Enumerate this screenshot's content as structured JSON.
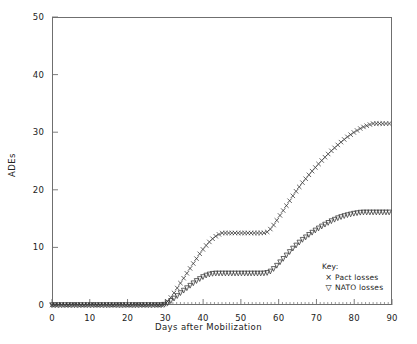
{
  "chart_data": {
    "type": "line",
    "title": "",
    "xlabel": "Days after Mobilization",
    "ylabel": "ADEs",
    "xlim": [
      0,
      90
    ],
    "ylim": [
      0,
      50
    ],
    "xticks": [
      0,
      10,
      20,
      30,
      40,
      50,
      60,
      70,
      80,
      90
    ],
    "yticks": [
      0,
      10,
      20,
      30,
      40,
      50
    ],
    "xtick_labels": [
      "0",
      "10",
      "20",
      "30",
      "40",
      "50",
      "60",
      "70",
      "80",
      "90"
    ],
    "ytick_labels": [
      "0",
      "10",
      "20",
      "30",
      "40",
      "50"
    ],
    "grid": false,
    "legend_position": "inside lower right",
    "legend_title": "Key:",
    "series": [
      {
        "name": "Pact losses",
        "marker": "x",
        "marker_glyph": "×",
        "color": "#333333",
        "x": [
          0,
          2,
          4,
          6,
          8,
          10,
          12,
          14,
          16,
          18,
          20,
          22,
          24,
          26,
          28,
          29,
          30,
          31,
          32,
          33,
          34,
          35,
          36,
          37,
          38,
          39,
          40,
          41,
          42,
          43,
          44,
          45,
          46,
          47,
          48,
          50,
          52,
          54,
          56,
          57,
          58,
          59,
          60,
          61,
          62,
          63,
          64,
          65,
          66,
          68,
          70,
          72,
          74,
          76,
          78,
          80,
          82,
          84,
          85,
          86,
          87,
          88,
          89,
          90
        ],
        "y": [
          0,
          0,
          0,
          0,
          0,
          0,
          0,
          0,
          0,
          0,
          0,
          0,
          0,
          0,
          0,
          0,
          0.2,
          0.9,
          1.8,
          2.8,
          3.8,
          4.8,
          5.8,
          6.8,
          7.8,
          8.8,
          9.7,
          10.5,
          11.2,
          11.8,
          12.2,
          12.5,
          12.5,
          12.5,
          12.5,
          12.5,
          12.5,
          12.5,
          12.5,
          12.7,
          13.3,
          14.2,
          15.2,
          16.2,
          17.2,
          18.2,
          19.2,
          20.1,
          21.0,
          22.6,
          24.1,
          25.5,
          26.8,
          28.0,
          29.1,
          30.0,
          30.8,
          31.3,
          31.5,
          31.5,
          31.5,
          31.5,
          31.5,
          31.5
        ]
      },
      {
        "name": "NATO losses",
        "marker": "triangle-down",
        "marker_glyph": "▽",
        "color": "#333333",
        "x": [
          0,
          2,
          4,
          6,
          8,
          10,
          12,
          14,
          16,
          18,
          20,
          22,
          24,
          26,
          28,
          29,
          30,
          31,
          32,
          33,
          34,
          35,
          36,
          37,
          38,
          39,
          40,
          41,
          42,
          43,
          44,
          45,
          46,
          47,
          48,
          50,
          52,
          54,
          56,
          57,
          58,
          59,
          60,
          61,
          62,
          63,
          64,
          65,
          66,
          68,
          70,
          72,
          74,
          76,
          78,
          80,
          82,
          84,
          85,
          86,
          87,
          88,
          89,
          90
        ],
        "y": [
          0,
          0,
          0,
          0,
          0,
          0,
          0,
          0,
          0,
          0,
          0,
          0,
          0,
          0,
          0,
          0,
          0.1,
          0.5,
          1.0,
          1.5,
          2.1,
          2.6,
          3.1,
          3.6,
          4.1,
          4.5,
          4.9,
          5.2,
          5.4,
          5.5,
          5.5,
          5.5,
          5.5,
          5.5,
          5.5,
          5.5,
          5.5,
          5.5,
          5.5,
          5.6,
          5.9,
          6.5,
          7.2,
          7.9,
          8.6,
          9.3,
          10.0,
          10.6,
          11.2,
          12.2,
          13.1,
          13.9,
          14.6,
          15.2,
          15.6,
          15.9,
          16.1,
          16.1,
          16.1,
          16.1,
          16.1,
          16.1,
          16.1,
          16.1
        ]
      }
    ],
    "annotations": []
  },
  "legend": {
    "title": "Key:",
    "entries": [
      {
        "marker": "×",
        "label": "Pact losses"
      },
      {
        "marker": "▽",
        "label": "NATO losses"
      }
    ]
  },
  "axes": {
    "x_title": "Days after Mobilization",
    "y_title": "ADEs"
  }
}
